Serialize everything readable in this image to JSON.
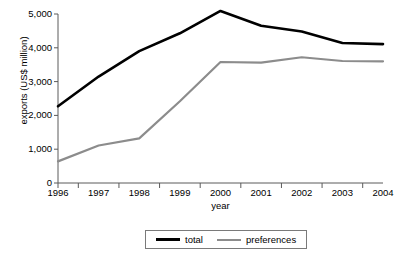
{
  "chart_data": {
    "type": "line",
    "title": "",
    "xlabel": "year",
    "ylabel": "exports (US$ million)",
    "categories": [
      "1996",
      "1997",
      "1998",
      "1999",
      "2000",
      "2001",
      "2002",
      "2003",
      "2004"
    ],
    "series": [
      {
        "name": "total",
        "color": "#000000",
        "values": [
          2270,
          3150,
          3900,
          4430,
          5090,
          4650,
          4480,
          4140,
          4110
        ]
      },
      {
        "name": "preferences",
        "color": "#8c8c8c",
        "values": [
          640,
          1110,
          1320,
          2420,
          3580,
          3560,
          3720,
          3610,
          3600
        ]
      }
    ],
    "ylim": [
      0,
      5000
    ],
    "ytick_values": [
      0,
      1000,
      2000,
      3000,
      4000,
      5000
    ],
    "ytick_labels": [
      "0",
      "1,000",
      "2,000",
      "3,000",
      "4,000",
      "5,000"
    ],
    "grid": false,
    "legend_position": "bottom-center",
    "axis_color": "#5a5a5a",
    "background": "#ffffff"
  },
  "axes": {
    "y_title": "exports (US$ million)",
    "x_title": "year"
  },
  "legend": {
    "items": [
      {
        "label": "total",
        "color": "#000000"
      },
      {
        "label": "preferences",
        "color": "#8c8c8c"
      }
    ]
  },
  "title_fragment": ""
}
